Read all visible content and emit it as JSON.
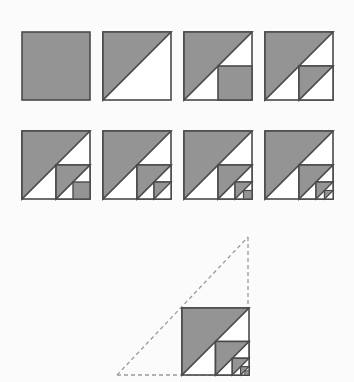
{
  "figure": {
    "canvas": {
      "width": 354,
      "height": 382,
      "background": "#fbfbfb"
    }
  },
  "style": {
    "fill_gray": "#949494",
    "fill_white": "#ffffff",
    "stroke_dark": "#4a4a4a",
    "stroke_dashed": "#9a9a9a",
    "stroke_width": 1.6,
    "dash_pattern": "4 3"
  },
  "layout": {
    "square_size": 68,
    "row1_y": 32,
    "row2_y": 131,
    "columns_x": [
      22,
      103,
      184,
      265
    ],
    "limit_square": {
      "x": 182,
      "y": 308,
      "size": 0
    }
  },
  "panels": [
    {
      "index": 1,
      "name": "panel-1",
      "label": "1",
      "depth": 0,
      "caption": "Whole square filled",
      "value_text": "1"
    },
    {
      "index": 2,
      "name": "panel-2",
      "label": "1/2",
      "depth": 1,
      "caption": "Upper-left half triangle",
      "value_text": "1/2"
    },
    {
      "index": 3,
      "name": "panel-3",
      "label": "1/2 + 1/8",
      "depth": 2,
      "caption": "Half triangle plus filled lower-right quarter",
      "value_text": "0.625"
    },
    {
      "index": 4,
      "name": "panel-4",
      "label": "1/2 + 1/8 + 1/32",
      "depth": 2,
      "caption": "Half triangle plus half of lower-right quarter",
      "value_text": "0.6406"
    },
    {
      "index": 5,
      "name": "panel-5",
      "label": "sum to 3 terms",
      "depth": 3,
      "caption": "Third level filled sub-quarter added",
      "value_text": "0.6563"
    },
    {
      "index": 6,
      "name": "panel-6",
      "label": "sum to 4 terms",
      "depth": 3,
      "caption": "Third level triangle added",
      "value_text": "0.6602"
    },
    {
      "index": 7,
      "name": "panel-7",
      "label": "sum to 5 terms",
      "depth": 4,
      "caption": "Fourth level filled sub-quarter added",
      "value_text": "0.6641"
    },
    {
      "index": 8,
      "name": "panel-8",
      "label": "sum to 6 terms",
      "depth": 4,
      "caption": "Fourth level triangle added",
      "value_text": "0.6650"
    },
    {
      "index": 9,
      "name": "panel-limit",
      "label": "limit = 2/3",
      "depth": 4,
      "caption": "Limit figure inscribed in dashed right triangle of double width and height",
      "value_text": "2/3"
    }
  ],
  "dashed_triangle": {
    "name": "construction-triangle",
    "apex": {
      "x": 248,
      "y": 237
    },
    "bottom_left": {
      "x": 117,
      "y": 375
    },
    "bottom_right": {
      "x": 248,
      "y": 375
    },
    "visible_edges": [
      "hypotenuse",
      "vertical-right",
      "baseline"
    ]
  }
}
